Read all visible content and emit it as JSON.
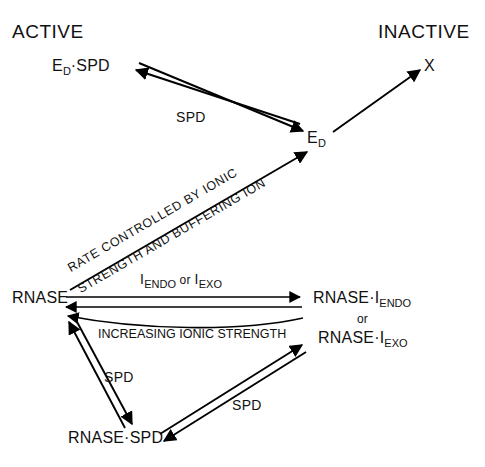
{
  "diagram": {
    "title_left": "ACTIVE",
    "title_right": "INACTIVE",
    "nodes": {
      "ed_spd": {
        "main": "E",
        "sub": "D",
        "tail": "·SPD"
      },
      "ed": {
        "main": "E",
        "sub": "D"
      },
      "x": {
        "main": "X"
      },
      "rnase": {
        "main": "RNASE"
      },
      "rnase_i_endo": {
        "main": "RNASE·I",
        "sub": "ENDO"
      },
      "or_word": "or",
      "rnase_i_exo": {
        "main": "RNASE·I",
        "sub": "EXO"
      },
      "rnase_spd": {
        "main": "RNASE·SPD"
      }
    },
    "edges": {
      "spd_top": "SPD",
      "rate_line1": "RATE CONTROLLED BY IONIC",
      "rate_line2": "STRENGTH AND BUFFERING ION",
      "i_endo_exo": {
        "pre": "I",
        "sub1": "ENDO",
        "mid": " or ",
        "post": "I",
        "sub2": "EXO"
      },
      "increasing_ionic": "INCREASING IONIC STRENGTH",
      "spd_left": "SPD",
      "spd_right": "SPD"
    },
    "colors": {
      "ink": "#000000",
      "background": "#ffffff"
    }
  }
}
